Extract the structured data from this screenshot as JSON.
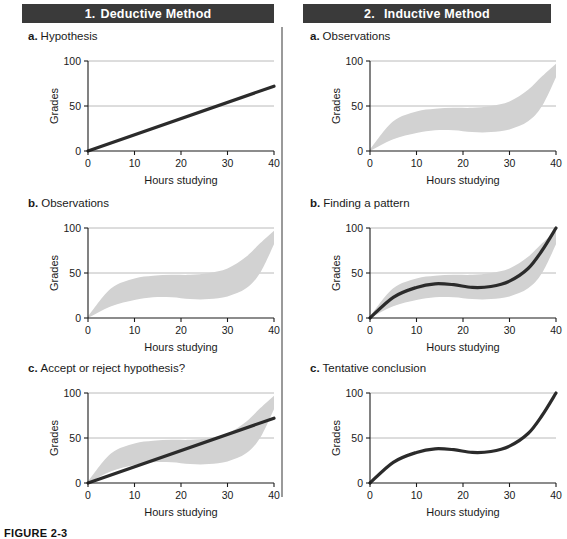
{
  "figure": {
    "caption": "FIGURE 2-3",
    "columns": [
      {
        "number": "1.",
        "title": "Deductive Method"
      },
      {
        "number": "2.",
        "title": "Inductive Method"
      }
    ]
  },
  "axes": {
    "xlabel": "Hours studying",
    "ylabel": "Grades",
    "xticks": [
      "0",
      "10",
      "20",
      "30",
      "40"
    ],
    "yticks": [
      "0",
      "50",
      "100"
    ],
    "xlim": [
      0,
      40
    ],
    "ylim": [
      0,
      100
    ]
  },
  "colors": {
    "banner_bg": "#3a3a3a",
    "banner_text": "#ffffff",
    "band_fill": "#d2d2d2",
    "curve": "#2b2b2b",
    "gridline": "#a8a8a8",
    "axis": "#1a1a1a",
    "divider": "#9a9a9a"
  },
  "panels": [
    {
      "letter": "a.",
      "label": "Hypothesis",
      "column": 1,
      "row": "a"
    },
    {
      "letter": "b.",
      "label": "Observations",
      "column": 1,
      "row": "b"
    },
    {
      "letter": "c.",
      "label": "Accept or reject hypothesis?",
      "column": 1,
      "row": "c"
    },
    {
      "letter": "a.",
      "label": "Observations",
      "column": 2,
      "row": "a"
    },
    {
      "letter": "b.",
      "label": "Finding a pattern",
      "column": 2,
      "row": "b"
    },
    {
      "letter": "c.",
      "label": "Tentative conclusion",
      "column": 2,
      "row": "c"
    }
  ],
  "chart_data": [
    {
      "id": "deductive-a",
      "type": "line",
      "title": "Hypothesis",
      "xlabel": "Hours studying",
      "ylabel": "Grades",
      "xlim": [
        0,
        40
      ],
      "ylim": [
        0,
        100
      ],
      "grid": true,
      "series": [
        {
          "name": "hypothesis",
          "kind": "line",
          "x": [
            0,
            40
          ],
          "y": [
            0,
            72
          ]
        }
      ]
    },
    {
      "id": "deductive-b",
      "type": "area",
      "title": "Observations",
      "xlabel": "Hours studying",
      "ylabel": "Grades",
      "xlim": [
        0,
        40
      ],
      "ylim": [
        0,
        100
      ],
      "grid": true,
      "series": [
        {
          "name": "observation band",
          "kind": "band",
          "x": [
            0,
            5,
            10,
            14,
            18,
            22,
            26,
            30,
            34,
            37,
            40
          ],
          "upper": [
            2,
            33,
            44,
            47,
            48,
            48,
            50,
            55,
            68,
            83,
            97
          ],
          "lower": [
            0,
            13,
            20,
            23,
            23,
            21,
            21,
            24,
            33,
            50,
            82
          ]
        }
      ]
    },
    {
      "id": "deductive-c",
      "type": "area",
      "title": "Accept or reject hypothesis?",
      "xlabel": "Hours studying",
      "ylabel": "Grades",
      "xlim": [
        0,
        40
      ],
      "ylim": [
        0,
        100
      ],
      "grid": true,
      "series": [
        {
          "name": "observation band",
          "kind": "band",
          "x": [
            0,
            5,
            10,
            14,
            18,
            22,
            26,
            30,
            34,
            37,
            40
          ],
          "upper": [
            2,
            33,
            44,
            47,
            48,
            48,
            50,
            55,
            68,
            83,
            97
          ],
          "lower": [
            0,
            13,
            20,
            23,
            23,
            21,
            21,
            24,
            33,
            50,
            82
          ]
        },
        {
          "name": "hypothesis",
          "kind": "line",
          "x": [
            0,
            40
          ],
          "y": [
            0,
            72
          ]
        }
      ]
    },
    {
      "id": "inductive-a",
      "type": "area",
      "title": "Observations",
      "xlabel": "Hours studying",
      "ylabel": "Grades",
      "xlim": [
        0,
        40
      ],
      "ylim": [
        0,
        100
      ],
      "grid": true,
      "series": [
        {
          "name": "observation band",
          "kind": "band",
          "x": [
            0,
            5,
            10,
            14,
            18,
            22,
            26,
            30,
            34,
            37,
            40
          ],
          "upper": [
            2,
            33,
            44,
            47,
            48,
            48,
            50,
            55,
            68,
            83,
            97
          ],
          "lower": [
            0,
            13,
            20,
            23,
            23,
            21,
            21,
            24,
            33,
            50,
            82
          ]
        }
      ]
    },
    {
      "id": "inductive-b",
      "type": "area",
      "title": "Finding a pattern",
      "xlabel": "Hours studying",
      "ylabel": "Grades",
      "xlim": [
        0,
        40
      ],
      "ylim": [
        0,
        100
      ],
      "grid": true,
      "series": [
        {
          "name": "observation band",
          "kind": "band",
          "x": [
            0,
            5,
            10,
            14,
            18,
            22,
            26,
            30,
            34,
            37,
            40
          ],
          "upper": [
            2,
            33,
            44,
            47,
            48,
            48,
            50,
            55,
            68,
            83,
            97
          ],
          "lower": [
            0,
            13,
            20,
            23,
            23,
            21,
            21,
            24,
            33,
            50,
            82
          ]
        },
        {
          "name": "fitted pattern",
          "kind": "curve",
          "x": [
            0,
            5,
            10,
            14,
            18,
            22,
            26,
            30,
            34,
            37,
            40
          ],
          "y": [
            0,
            23,
            34,
            38,
            37,
            34,
            35,
            41,
            55,
            75,
            100
          ]
        }
      ]
    },
    {
      "id": "inductive-c",
      "type": "line",
      "title": "Tentative conclusion",
      "xlabel": "Hours studying",
      "ylabel": "Grades",
      "xlim": [
        0,
        40
      ],
      "ylim": [
        0,
        100
      ],
      "grid": true,
      "series": [
        {
          "name": "tentative conclusion",
          "kind": "curve",
          "x": [
            0,
            5,
            10,
            14,
            18,
            22,
            26,
            30,
            34,
            37,
            40
          ],
          "y": [
            0,
            23,
            34,
            38,
            37,
            34,
            35,
            41,
            55,
            75,
            100
          ]
        }
      ]
    }
  ]
}
